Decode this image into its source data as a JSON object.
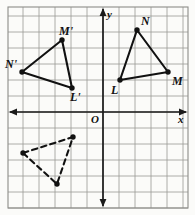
{
  "figure": {
    "type": "coordinate-plane-reflection",
    "origin_label": "O",
    "x_axis_label": "x",
    "y_axis_label": "y",
    "grid": {
      "visible": true,
      "cell_px": 16,
      "origin_px": [
        103,
        112
      ],
      "color": "#9a9a96",
      "axis_color": "#1a1a1a",
      "border_color": "#8d8d89"
    },
    "axes": {
      "x_arrow_left": true,
      "x_arrow_right": true,
      "y_arrow_up": true,
      "y_arrow_down": true
    },
    "shapes": [
      {
        "name": "triangle-LMN",
        "style": "solid",
        "color": "#111111",
        "vertices": [
          {
            "label": "L",
            "x": 1,
            "y": 2,
            "px": [
              120,
              80
            ],
            "label_px": [
              113,
              82
            ],
            "label_dx": 0,
            "label_dy": 12
          },
          {
            "label": "M",
            "x": 4,
            "y": 2.5,
            "px": [
              168,
              72
            ],
            "label_px": [
              172,
              74
            ],
            "label_dx": 6,
            "label_dy": 6
          },
          {
            "label": "N",
            "x": 2,
            "y": 5,
            "px": [
              137,
              30
            ],
            "label_px": [
              141,
              14
            ],
            "label_dx": 6,
            "label_dy": -14
          }
        ]
      },
      {
        "name": "triangle-L-prime-M-prime-N-prime",
        "style": "solid",
        "color": "#111111",
        "vertices": [
          {
            "label": "N'",
            "x": -5,
            "y": 2.5,
            "px": [
              22,
              72
            ],
            "label_px": [
              6,
              58
            ],
            "label_dx": -16,
            "label_dy": -12
          },
          {
            "label": "M'",
            "x": -2.5,
            "y": 4.5,
            "px": [
              62,
              40
            ],
            "label_px": [
              60,
              24
            ],
            "label_dx": 0,
            "label_dy": -14
          },
          {
            "label": "L'",
            "x": -2,
            "y": 1.5,
            "px": [
              72,
              88
            ],
            "label_px": [
              70,
              92
            ],
            "label_dx": 0,
            "label_dy": 12
          }
        ]
      },
      {
        "name": "triangle-dashed-image",
        "style": "dashed",
        "color": "#111111",
        "vertices": [
          {
            "label": "",
            "x": -5,
            "y": -2.5,
            "px": [
              23,
              153
            ]
          },
          {
            "label": "",
            "x": -2,
            "y": -1.5,
            "px": [
              73,
              137
            ]
          },
          {
            "label": "",
            "x": -3,
            "y": -4.5,
            "px": [
              57,
              184
            ]
          }
        ]
      }
    ]
  }
}
